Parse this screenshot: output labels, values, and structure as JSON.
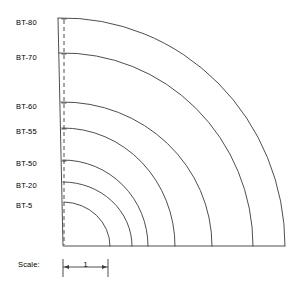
{
  "diagram": {
    "type": "quarter-arc-profile-chart",
    "origin": {
      "x": 63,
      "y": 246
    },
    "unit_px": 45,
    "top_left": {
      "x": 58,
      "y": 18
    },
    "dashed_line_x": 64,
    "baseline_y": 246,
    "stroke_color": "#3a3a3a",
    "background_color": "#ffffff",
    "arcs": [
      {
        "label": "BT-80",
        "radius_px": 222,
        "label_y": 22,
        "edge_x": 58,
        "edge_y": 18
      },
      {
        "label": "BT-70",
        "radius_px": 190,
        "label_y": 57,
        "edge_x": 59,
        "edge_y": 53
      },
      {
        "label": "BT-60",
        "radius_px": 149,
        "label_y": 106,
        "edge_x": 61,
        "edge_y": 102
      },
      {
        "label": "BT-55",
        "radius_px": 112,
        "label_y": 131,
        "edge_x": 62,
        "edge_y": 128
      },
      {
        "label": "BT-50",
        "radius_px": 85,
        "label_y": 163,
        "edge_x": 63,
        "edge_y": 160
      },
      {
        "label": "BT-20",
        "radius_px": 69,
        "label_y": 185,
        "edge_x": 63,
        "edge_y": 182
      },
      {
        "label": "BT-5",
        "radius_px": 47,
        "label_y": 205,
        "edge_x": 64,
        "edge_y": 202
      }
    ],
    "labels_x": 16
  },
  "scale": {
    "caption": "Scale:",
    "value": "1",
    "caption_x": 18,
    "caption_y": 264,
    "bar_left_x": 63,
    "bar_right_x": 108,
    "bar_y": 267,
    "tick_top_y": 259,
    "tick_bottom_y": 277
  }
}
